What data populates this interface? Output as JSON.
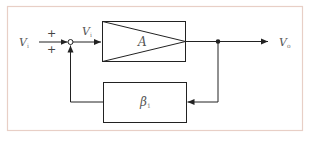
{
  "diagram": {
    "type": "feedback-block-diagram",
    "frame_color": "#e8cfc6",
    "line_color": "#222222",
    "input": {
      "label": "V",
      "subscript": "i"
    },
    "summing_junction": {
      "signs": [
        "+",
        "+"
      ]
    },
    "error_signal": {
      "label": "V",
      "subscript": "i"
    },
    "forward_block": {
      "label": "A",
      "shape": "amplifier-triangle-in-box"
    },
    "feedback_block": {
      "label": "β",
      "subscript": "1"
    },
    "output": {
      "label": "V",
      "subscript": "o"
    }
  }
}
